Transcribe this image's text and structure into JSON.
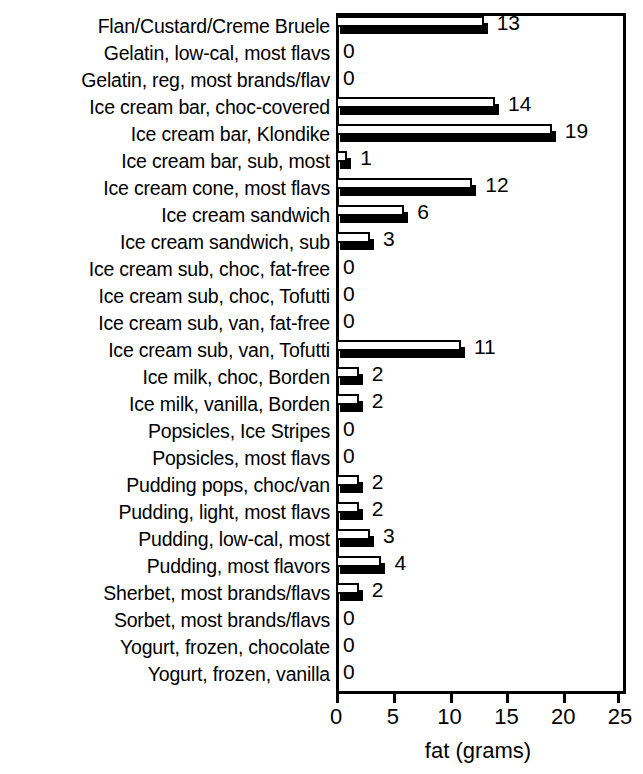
{
  "chart_data": {
    "type": "bar",
    "orientation": "horizontal",
    "title": "",
    "xlabel": "fat (grams)",
    "ylabel": "",
    "xlim": [
      0,
      25
    ],
    "xticks": [
      0,
      5,
      10,
      15,
      20,
      25
    ],
    "grid": false,
    "legend": null,
    "categories": [
      "Flan/Custard/Creme Bruele",
      "Gelatin, low-cal, most flavs",
      "Gelatin, reg, most brands/flav",
      "Ice cream bar, choc-covered",
      "Ice cream bar, Klondike",
      "Ice cream bar, sub, most",
      "Ice cream cone, most flavs",
      "Ice cream sandwich",
      "Ice cream sandwich, sub",
      "Ice cream sub, choc, fat-free",
      "Ice cream sub, choc, Tofutti",
      "Ice cream sub, van, fat-free",
      "Ice cream sub, van, Tofutti",
      "Ice milk, choc, Borden",
      "Ice milk, vanilla, Borden",
      "Popsicles, Ice Stripes",
      "Popsicles, most flavs",
      "Pudding pops, choc/van",
      "Pudding, light, most flavs",
      "Pudding, low-cal, most",
      "Pudding, most flavors",
      "Sherbet, most brands/flavs",
      "Sorbet, most brands/flavs",
      "Yogurt, frozen, chocolate",
      "Yogurt, frozen, vanilla"
    ],
    "values": [
      13,
      0,
      0,
      14,
      19,
      1,
      12,
      6,
      3,
      0,
      0,
      0,
      11,
      2,
      2,
      0,
      0,
      2,
      2,
      3,
      4,
      2,
      0,
      0,
      0
    ],
    "value_labels": [
      "13",
      "0",
      "0",
      "14",
      "19",
      "1",
      "12",
      "6",
      "3",
      "0",
      "0",
      "0",
      "11",
      "2",
      "2",
      "0",
      "0",
      "2",
      "2",
      "3",
      "4",
      "2",
      "0",
      "0",
      "0"
    ],
    "xtick_labels": [
      "0",
      "5",
      "10",
      "15",
      "20",
      "25"
    ],
    "colors": {
      "bar_face": "#ffffff",
      "bar_edge": "#000000",
      "bar_shadow": "#000000",
      "axis": "#000000",
      "background": "#ffffff",
      "text": "#000000"
    }
  }
}
